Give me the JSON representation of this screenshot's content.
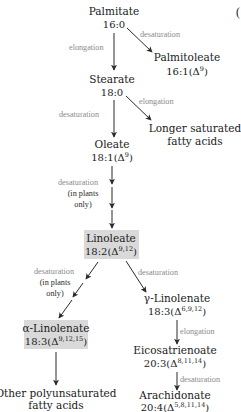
{
  "diagram": {
    "type": "metabolic-pathway",
    "highlight_color": "#d9d9d9",
    "label_color": "#8a8a8a",
    "corner_glyph": "(",
    "nodes": {
      "palmitate": {
        "name": "Palmitate",
        "formula": "16:0",
        "sup": ""
      },
      "palmitoleate": {
        "name": "Palmitoleate",
        "formula_pre": "16:1(Δ",
        "sup": "9",
        "formula_post": ")"
      },
      "stearate": {
        "name": "Stearate",
        "formula": "18:0",
        "sup": ""
      },
      "longer_saturated": {
        "line1": "Longer saturated",
        "line2": "fatty acids"
      },
      "oleate": {
        "name": "Oleate",
        "formula_pre": "18:1(Δ",
        "sup": "9",
        "formula_post": ")"
      },
      "linoleate": {
        "name": "Linoleate",
        "formula_pre": "18:2(Δ",
        "sup": "9,12",
        "formula_post": ")",
        "highlighted": true
      },
      "alpha_linolenate": {
        "name": "α-Linolenate",
        "formula_pre": "18:3(Δ",
        "sup": "9,12,15",
        "formula_post": ")",
        "highlighted": true
      },
      "gamma_linolenate": {
        "name": "γ-Linolenate",
        "formula_pre": "18:3(Δ",
        "sup": "6,9,12",
        "formula_post": ")"
      },
      "eicosatrienoate": {
        "name": "Eicosatrienoate",
        "formula_pre": "20:3(Δ",
        "sup": "8,11,14",
        "formula_post": ")"
      },
      "arachidonate": {
        "name": "Arachidonate",
        "formula_pre": "20:4(Δ",
        "sup": "5,8,11,14",
        "formula_post": ")"
      },
      "other_polyunsaturated": {
        "line1": "Other polyunsaturated",
        "line2": "fatty acids"
      }
    },
    "edges": {
      "palmitate_stearate": {
        "label": "elongation"
      },
      "palmitate_palmitoleate": {
        "label": "desaturation"
      },
      "stearate_longer": {
        "label": "elongation"
      },
      "stearate_oleate": {
        "label": "desaturation"
      },
      "oleate_linoleate": {
        "label": "desaturation",
        "note1": "(in plants",
        "note2": "only)"
      },
      "linoleate_alpha": {
        "label": "desaturation",
        "note1": "(in plants",
        "note2": "only)"
      },
      "linoleate_gamma": {
        "label": "desaturation"
      },
      "gamma_eicosatrienoate": {
        "label": "elongation"
      },
      "eicosatrienoate_arachidonate": {
        "label": "desaturation"
      },
      "alpha_other": {
        "label": ""
      }
    }
  }
}
